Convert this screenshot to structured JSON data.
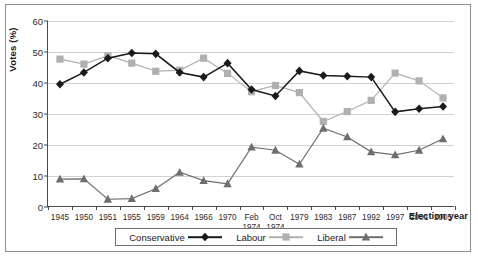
{
  "chart_data": {
    "type": "line",
    "title": "",
    "xlabel": "Election year",
    "ylabel": "Votes (%)",
    "ylim": [
      0,
      60
    ],
    "ytick_step": 10,
    "yticks": [
      "0",
      "10",
      "20",
      "30",
      "40",
      "50",
      "60"
    ],
    "grid": true,
    "legend_position": "bottom",
    "categories": [
      "1945",
      "1950",
      "1951",
      "1955",
      "1959",
      "1964",
      "1966",
      "1970",
      "Feb\n1974",
      "Oct\n1974",
      "1979",
      "1983",
      "1987",
      "1992",
      "1997",
      "2001",
      "2005"
    ],
    "series": [
      {
        "name": "Conservative",
        "marker": "diamond",
        "color": "#1a1a1a",
        "values": [
          39.6,
          43.4,
          48.0,
          49.7,
          49.4,
          43.4,
          41.9,
          46.4,
          37.9,
          35.8,
          43.9,
          42.4,
          42.2,
          41.9,
          30.7,
          31.7,
          32.4
        ]
      },
      {
        "name": "Labour",
        "marker": "square",
        "color": "#b0b0b0",
        "values": [
          47.7,
          46.1,
          48.8,
          46.4,
          43.8,
          44.1,
          48.0,
          43.1,
          37.2,
          39.2,
          36.9,
          27.6,
          30.8,
          34.4,
          43.2,
          40.7,
          35.2
        ]
      },
      {
        "name": "Liberal",
        "marker": "triangle",
        "color": "#6e6e6e",
        "values": [
          9.0,
          9.1,
          2.5,
          2.7,
          5.9,
          11.2,
          8.5,
          7.5,
          19.3,
          18.3,
          13.8,
          25.4,
          22.6,
          17.8,
          16.8,
          18.3,
          22.0
        ]
      }
    ]
  },
  "legend": {
    "entries": [
      {
        "label": "Conservative"
      },
      {
        "label": "Labour"
      },
      {
        "label": "Liberal"
      }
    ]
  },
  "axis_titles": {
    "y": "Votes (%)",
    "x": "Election year"
  }
}
